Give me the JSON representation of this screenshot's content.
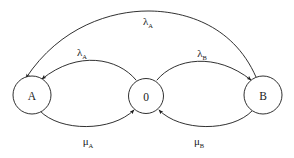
{
  "diagram": {
    "type": "state-transition-diagram",
    "background_color": "#ffffff",
    "stroke_color": "#1a1a1a",
    "nodes": [
      {
        "id": "A",
        "label": "A",
        "cx": 32,
        "cy": 95,
        "r": 19
      },
      {
        "id": "0",
        "label": "0",
        "cx": 146,
        "cy": 96,
        "r": 17.5
      },
      {
        "id": "B",
        "label": "B",
        "cx": 263,
        "cy": 95,
        "r": 19
      }
    ],
    "edges": [
      {
        "id": "edge-zero-to-a",
        "from": "0",
        "to": "A",
        "symbol": "λ",
        "subscript": "A",
        "label_x": 82,
        "label_y": 56,
        "position": "upper-left"
      },
      {
        "id": "edge-zero-to-b",
        "from": "0",
        "to": "B",
        "symbol": "λ",
        "subscript": "B",
        "label_x": 202,
        "label_y": 57,
        "position": "upper-right"
      },
      {
        "id": "edge-b-to-a",
        "from": "B",
        "to": "A",
        "symbol": "λ",
        "subscript": "A",
        "label_x": 148,
        "label_y": 25,
        "position": "top-outer"
      },
      {
        "id": "edge-a-to-zero",
        "from": "A",
        "to": "0",
        "symbol": "μ",
        "subscript": "A",
        "label_x": 88,
        "label_y": 145,
        "position": "lower-left"
      },
      {
        "id": "edge-b-to-zero",
        "from": "B",
        "to": "0",
        "symbol": "μ",
        "subscript": "B",
        "label_x": 199,
        "label_y": 145,
        "position": "lower-right"
      }
    ]
  }
}
